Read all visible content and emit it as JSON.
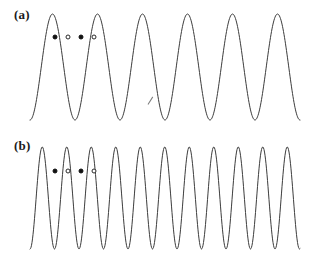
{
  "figure": {
    "background_color": "#ffffff",
    "line_color": "#3c3c3c",
    "line_width": 1,
    "width": 309,
    "height": 263
  },
  "panels": [
    {
      "id": "a",
      "label": "(a)",
      "top": 0,
      "height": 131,
      "markers": [
        {
          "x": 55,
          "y": 37,
          "style": "filled"
        },
        {
          "x": 68,
          "y": 37,
          "style": "open"
        },
        {
          "x": 81,
          "y": 37,
          "style": "filled"
        },
        {
          "x": 94,
          "y": 37,
          "style": "open"
        }
      ],
      "artifacts": [
        {
          "x": 148,
          "y": 104,
          "angle": -58,
          "length": 9
        }
      ]
    },
    {
      "id": "b",
      "label": "(b)",
      "top": 131,
      "height": 131,
      "markers": [
        {
          "x": 55,
          "y": 40,
          "style": "filled"
        },
        {
          "x": 68,
          "y": 40,
          "style": "open"
        },
        {
          "x": 81,
          "y": 40,
          "style": "filled"
        },
        {
          "x": 94,
          "y": 40,
          "style": "open"
        }
      ],
      "artifacts": []
    }
  ],
  "chart_data": [
    {
      "type": "line",
      "title": "(a)",
      "xlabel": "",
      "ylabel": "",
      "xlim": [
        30,
        300
      ],
      "ylim": [
        14,
        120
      ],
      "grid": false,
      "axes_visible": false,
      "legend": "none",
      "waveform": "sinusoid",
      "cycles": 6,
      "period_px": 45,
      "phase_deg": -90,
      "amplitude_px": 53,
      "baseline_y_px": 67,
      "peak_y_px": 14,
      "trough_y_px": 120,
      "x_start_px": 30,
      "x_end_px": 300,
      "series": [
        {
          "name": "wave-a",
          "x": [
            30,
            41,
            52,
            64,
            75,
            86,
            98,
            109,
            120,
            131,
            143,
            154,
            165,
            176,
            188,
            199,
            210,
            221,
            233,
            244,
            255,
            266,
            278,
            289,
            300
          ],
          "y": [
            120,
            94,
            44,
            15,
            32,
            80,
            118,
            105,
            57,
            17,
            21,
            62,
            110,
            116,
            73,
            25,
            15,
            48,
            101,
            120,
            88,
            36,
            14,
            37,
            86
          ]
        }
      ]
    },
    {
      "type": "line",
      "title": "(b)",
      "xlabel": "",
      "ylabel": "",
      "xlim": [
        30,
        300
      ],
      "ylim": [
        16,
        119
      ],
      "grid": false,
      "axes_visible": false,
      "legend": "none",
      "waveform": "sinusoid",
      "cycles": 11,
      "period_px": 24.5,
      "phase_deg": -90,
      "amplitude_px": 51,
      "baseline_y_px": 67,
      "peak_y_px": 16,
      "trough_y_px": 119,
      "x_start_px": 30,
      "x_end_px": 300,
      "series": [
        {
          "name": "wave-b",
          "x": [
            30,
            36,
            42,
            49,
            55,
            61,
            67,
            73,
            79,
            85,
            91,
            98,
            104,
            110,
            116,
            122,
            128,
            134,
            140,
            147,
            153,
            159,
            165,
            171,
            177,
            183,
            189,
            196,
            202,
            208,
            214,
            220,
            226,
            232,
            238,
            245,
            251,
            257,
            263,
            269,
            275,
            281,
            287,
            294,
            300
          ],
          "y": [
            119,
            80,
            28,
            17,
            54,
            104,
            117,
            72,
            22,
            19,
            62,
            110,
            113,
            62,
            18,
            24,
            72,
            115,
            105,
            52,
            17,
            31,
            81,
            118,
            94,
            42,
            16,
            41,
            91,
            119,
            82,
            32,
            17,
            53,
            102,
            117,
            70,
            23,
            20,
            63,
            110,
            112,
            60,
            18,
            26
          ]
        }
      ]
    }
  ]
}
